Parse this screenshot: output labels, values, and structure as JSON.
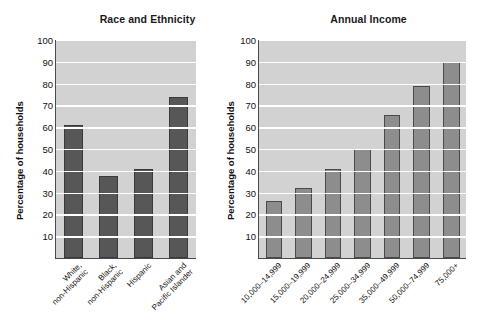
{
  "figure": {
    "ylabel": "Percentage of households",
    "yticks": [
      "100",
      "90",
      "80",
      "70",
      "60",
      "50",
      "40",
      "30",
      "20",
      "10"
    ],
    "colors": {
      "plot_background": "#d2d2d2",
      "gridline": "#ffffff",
      "bar_left": "#575757",
      "bar_right": "#8d8d8d",
      "axis": "#4a4a4a",
      "text": "#111111"
    }
  },
  "chart_data": [
    {
      "type": "bar",
      "title": "Race and Ethnicity",
      "xlabel": "",
      "ylabel": "Percentage of households",
      "ylim": [
        0,
        100
      ],
      "yticks": [
        10,
        20,
        30,
        40,
        50,
        60,
        70,
        80,
        90,
        100
      ],
      "grid": true,
      "legend": "none",
      "categories": [
        "White, non-Hispanic",
        "Black, non-Hispanic",
        "Hispanic",
        "Asian and Pacific Islander"
      ],
      "category_lines": [
        [
          "White,",
          "non-Hispanic"
        ],
        [
          "Black,",
          "non-Hispanic"
        ],
        [
          "Hispanic",
          ""
        ],
        [
          "Asian and",
          "Pacific Islander"
        ]
      ],
      "values": [
        61,
        37.5,
        41,
        74
      ]
    },
    {
      "type": "bar",
      "title": "Annual Income",
      "xlabel": "",
      "ylabel": "Percentage of households",
      "ylim": [
        0,
        100
      ],
      "yticks": [
        10,
        20,
        30,
        40,
        50,
        60,
        70,
        80,
        90,
        100
      ],
      "grid": true,
      "legend": "none",
      "categories": [
        "10,000–14,999",
        "15,000–19,999",
        "20,000–24,999",
        "25,000–34,999",
        "35,000–49,999",
        "50,000–74,999",
        "75,000+"
      ],
      "category_lines": [
        [
          "10,000–14,999",
          ""
        ],
        [
          "15,000–19,999",
          ""
        ],
        [
          "20,000–24,999",
          ""
        ],
        [
          "25,000–34,999",
          ""
        ],
        [
          "35,000–49,999",
          ""
        ],
        [
          "50,000–74,999",
          ""
        ],
        [
          "75,000+",
          ""
        ]
      ],
      "values": [
        26,
        32,
        41,
        50,
        65.5,
        79,
        90
      ]
    }
  ]
}
